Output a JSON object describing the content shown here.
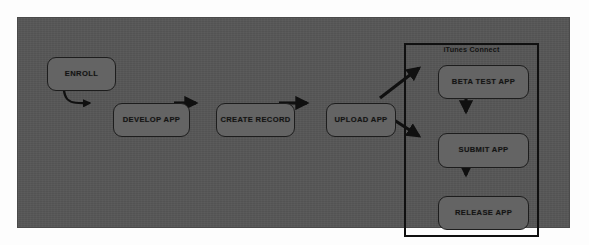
{
  "diagram": {
    "canvas": {
      "background_color": "#575757",
      "border_color": "#4a4a4a",
      "node_fill_color": "#646464",
      "node_border_color": "#1d1d1d",
      "connector_color": "#101010",
      "text_color": "#141414"
    },
    "group": {
      "name": "itunes-connect",
      "label": "iTunes Connect",
      "border_color": "#101010"
    },
    "nodes": [
      {
        "id": "enroll",
        "label": "ENROLL",
        "shape": "rounded-rectangle"
      },
      {
        "id": "develop-app",
        "label": "DEVELOP APP",
        "shape": "rounded-rectangle"
      },
      {
        "id": "create-record",
        "label": "CREATE RECORD",
        "shape": "rounded-rectangle"
      },
      {
        "id": "upload-app",
        "label": "UPLOAD APP",
        "shape": "rounded-rectangle"
      },
      {
        "id": "beta-test-app",
        "label": "BETA TEST APP",
        "shape": "rounded-rectangle",
        "group": "itunes-connect"
      },
      {
        "id": "submit-app",
        "label": "SUBMIT APP",
        "shape": "rounded-rectangle",
        "group": "itunes-connect"
      },
      {
        "id": "release-app",
        "label": "RELEASE APP",
        "shape": "rounded-rectangle",
        "group": "itunes-connect"
      }
    ],
    "edges": [
      {
        "from": "enroll",
        "to": "develop-app",
        "style": "curved",
        "arrowhead": true
      },
      {
        "from": "develop-app",
        "to": "create-record",
        "style": "straight",
        "arrowhead": true
      },
      {
        "from": "create-record",
        "to": "upload-app",
        "style": "straight",
        "arrowhead": true
      },
      {
        "from": "upload-app",
        "to": "beta-test-app",
        "style": "straight",
        "arrowhead": true
      },
      {
        "from": "upload-app",
        "to": "submit-app",
        "style": "straight",
        "arrowhead": true
      },
      {
        "from": "beta-test-app",
        "to": "submit-app",
        "style": "straight",
        "arrowhead": true
      },
      {
        "from": "submit-app",
        "to": "release-app",
        "style": "straight",
        "arrowhead": true
      }
    ]
  }
}
